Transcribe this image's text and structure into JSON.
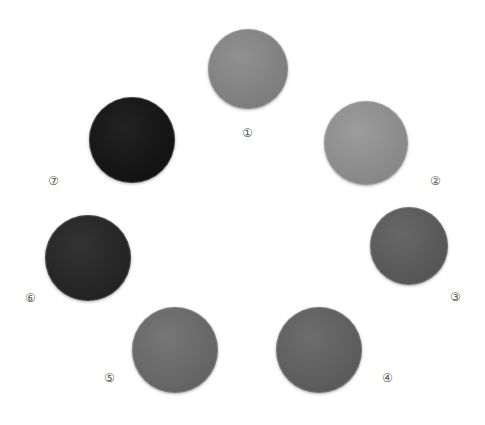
{
  "swatches": [
    {
      "label": "①",
      "color": "#8a8a8a",
      "cx": 248,
      "cy": 69,
      "r": 40,
      "lx": 242,
      "ly": 127
    },
    {
      "label": "②",
      "color": "#969696",
      "cx": 366,
      "cy": 143,
      "r": 42,
      "lx": 430,
      "ly": 175
    },
    {
      "label": "③",
      "color": "#5e5e5e",
      "cx": 409,
      "cy": 246,
      "r": 39,
      "lx": 450,
      "ly": 291
    },
    {
      "label": "④",
      "color": "#646464",
      "cx": 319,
      "cy": 350,
      "r": 43,
      "lx": 382,
      "ly": 372
    },
    {
      "label": "⑤",
      "color": "#6e6e6e",
      "cx": 175,
      "cy": 350,
      "r": 43,
      "lx": 104,
      "ly": 372
    },
    {
      "label": "⑥",
      "color": "#262626",
      "cx": 88,
      "cy": 258,
      "r": 43,
      "lx": 25,
      "ly": 292
    },
    {
      "label": "⑦",
      "color": "#141414",
      "cx": 132,
      "cy": 140,
      "r": 43,
      "lx": 48,
      "ly": 175
    }
  ]
}
